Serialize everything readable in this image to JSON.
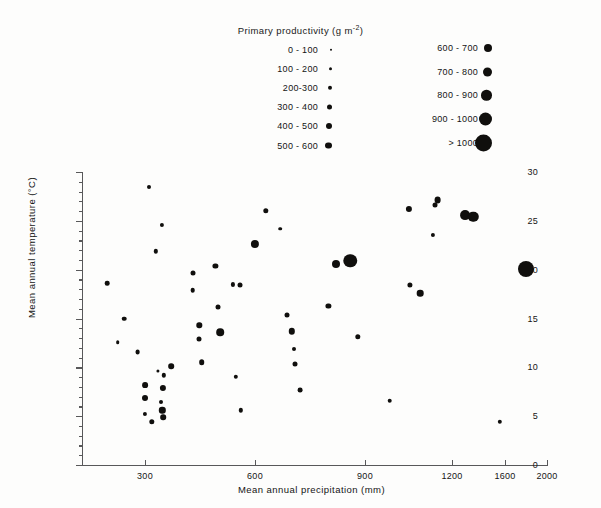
{
  "legend": {
    "title_main": "Primary productivity (g m",
    "title_sup": "-2",
    "title_close": ")",
    "title_full": "Primary productivity (g m-2)",
    "left_column": [
      {
        "label": "0 - 100",
        "size": 2.4
      },
      {
        "label": "100 - 200",
        "size": 3.4
      },
      {
        "label": "200-300",
        "size": 4.4
      },
      {
        "label": "300 - 400",
        "size": 5.2
      },
      {
        "label": "400 - 500",
        "size": 6.0
      },
      {
        "label": "500 - 600",
        "size": 6.8
      }
    ],
    "right_column": [
      {
        "label": "600 - 700",
        "size": 8.0
      },
      {
        "label": "700 - 800",
        "size": 9.0
      },
      {
        "label": "800 - 900",
        "size": 10.6
      },
      {
        "label": "900 - 1000",
        "size": 13.0
      },
      {
        "label": "> 1000",
        "size": 17.0
      }
    ]
  },
  "axes": {
    "x_label": "Mean annual precipitation (mm)",
    "y_label": "Mean annual temperature (°C)",
    "x_ticks": [
      {
        "label": "300",
        "value": 300,
        "px": 63
      },
      {
        "label": "600",
        "value": 600,
        "px": 173
      },
      {
        "label": "900",
        "value": 900,
        "px": 283
      },
      {
        "label": "1200",
        "value": 1200,
        "px": 370
      },
      {
        "label": "1600",
        "value": 1600,
        "px": 423
      },
      {
        "label": "2000",
        "value": 2000,
        "px": 465
      }
    ],
    "y_ticks_major": [
      "0",
      "5",
      "10",
      "15",
      "20",
      "25",
      "30"
    ],
    "y_min": 0,
    "y_max": 30,
    "y_minor_step": 1
  },
  "chart_data": {
    "type": "scatter",
    "title": "Primary productivity (g m-2)",
    "xlabel": "Mean annual precipitation (mm)",
    "ylabel": "Mean annual temperature (°C)",
    "ylim": [
      0,
      30
    ],
    "xlim": [
      0,
      2000
    ],
    "x_scale": "compressed-nonlinear",
    "grid": false,
    "legend_position": "top",
    "size_encodes": "Primary productivity (g m-2)",
    "marker_color": "#100f0d",
    "points": [
      {
        "x": 120,
        "y": 18.6,
        "size": 4.6
      },
      {
        "x": 200,
        "y": 15.0,
        "size": 4.6
      },
      {
        "x": 170,
        "y": 12.6,
        "size": 3.6
      },
      {
        "x": 265,
        "y": 11.6,
        "size": 4.8
      },
      {
        "x": 310,
        "y": 28.5,
        "size": 4.0
      },
      {
        "x": 345,
        "y": 24.6,
        "size": 4.2
      },
      {
        "x": 330,
        "y": 21.9,
        "size": 4.4
      },
      {
        "x": 352,
        "y": 9.2,
        "size": 4.4
      },
      {
        "x": 300,
        "y": 8.2,
        "size": 5.8
      },
      {
        "x": 300,
        "y": 6.9,
        "size": 6.0
      },
      {
        "x": 335,
        "y": 9.6,
        "size": 3.2
      },
      {
        "x": 348,
        "y": 7.9,
        "size": 6.2
      },
      {
        "x": 372,
        "y": 10.1,
        "size": 5.6
      },
      {
        "x": 343,
        "y": 6.4,
        "size": 4.0
      },
      {
        "x": 347,
        "y": 5.6,
        "size": 6.4
      },
      {
        "x": 349,
        "y": 4.9,
        "size": 5.6
      },
      {
        "x": 300,
        "y": 5.2,
        "size": 4.2
      },
      {
        "x": 318,
        "y": 4.4,
        "size": 5.4
      },
      {
        "x": 432,
        "y": 19.7,
        "size": 5.0
      },
      {
        "x": 430,
        "y": 17.9,
        "size": 4.6
      },
      {
        "x": 448,
        "y": 14.3,
        "size": 5.4
      },
      {
        "x": 447,
        "y": 12.9,
        "size": 5.0
      },
      {
        "x": 455,
        "y": 10.5,
        "size": 5.6
      },
      {
        "x": 492,
        "y": 20.4,
        "size": 5.2
      },
      {
        "x": 500,
        "y": 16.2,
        "size": 5.0
      },
      {
        "x": 505,
        "y": 13.6,
        "size": 7.6
      },
      {
        "x": 540,
        "y": 18.5,
        "size": 4.2
      },
      {
        "x": 560,
        "y": 18.4,
        "size": 5.0
      },
      {
        "x": 548,
        "y": 9.0,
        "size": 4.4
      },
      {
        "x": 562,
        "y": 5.6,
        "size": 4.4
      },
      {
        "x": 600,
        "y": 22.6,
        "size": 8.2
      },
      {
        "x": 630,
        "y": 26.0,
        "size": 5.4
      },
      {
        "x": 668,
        "y": 24.2,
        "size": 3.6
      },
      {
        "x": 688,
        "y": 15.4,
        "size": 5.0
      },
      {
        "x": 700,
        "y": 13.7,
        "size": 6.4
      },
      {
        "x": 706,
        "y": 11.9,
        "size": 4.0
      },
      {
        "x": 710,
        "y": 10.3,
        "size": 5.0
      },
      {
        "x": 722,
        "y": 7.7,
        "size": 4.8
      },
      {
        "x": 800,
        "y": 16.3,
        "size": 5.2
      },
      {
        "x": 820,
        "y": 20.6,
        "size": 8.0
      },
      {
        "x": 860,
        "y": 20.9,
        "size": 13.5
      },
      {
        "x": 880,
        "y": 13.1,
        "size": 5.4
      },
      {
        "x": 985,
        "y": 6.6,
        "size": 4.6
      },
      {
        "x": 1050,
        "y": 26.2,
        "size": 6.2
      },
      {
        "x": 1055,
        "y": 18.4,
        "size": 5.2
      },
      {
        "x": 1090,
        "y": 17.6,
        "size": 6.6
      },
      {
        "x": 1150,
        "y": 27.1,
        "size": 6.8
      },
      {
        "x": 1140,
        "y": 26.6,
        "size": 5.0
      },
      {
        "x": 1135,
        "y": 23.6,
        "size": 4.2
      },
      {
        "x": 1300,
        "y": 25.6,
        "size": 9.8
      },
      {
        "x": 1360,
        "y": 25.4,
        "size": 10.4
      },
      {
        "x": 1560,
        "y": 4.4,
        "size": 4.4
      },
      {
        "x": 1800,
        "y": 20.1,
        "size": 16.0
      }
    ]
  }
}
